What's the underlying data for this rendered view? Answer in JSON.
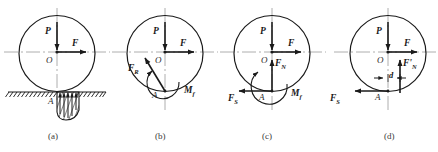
{
  "figure": {
    "stroke_color": "#1a1a1a",
    "axis_color": "#9a9a9a",
    "panels": [
      {
        "id": "a",
        "caption": "(a)",
        "center_label": "O",
        "contact_label": "A",
        "forces": [
          {
            "name": "P",
            "label": "P",
            "direction": "down"
          },
          {
            "name": "F",
            "label": "F",
            "direction": "right"
          }
        ],
        "features": [
          "ground-line",
          "hatched-ground",
          "distributed-pressure-arrows",
          "deformation-region"
        ]
      },
      {
        "id": "b",
        "caption": "(b)",
        "center_label": "O",
        "contact_label": "A",
        "forces": [
          {
            "name": "P",
            "label": "P",
            "direction": "down"
          },
          {
            "name": "F",
            "label": "F",
            "direction": "right"
          },
          {
            "name": "F_R",
            "label": "F",
            "sub": "R",
            "direction": "up-left"
          }
        ],
        "moments": [
          {
            "name": "M_f",
            "label": "M",
            "sub": "f",
            "sense": "counterclockwise"
          }
        ]
      },
      {
        "id": "c",
        "caption": "(c)",
        "center_label": "O",
        "contact_label": "A",
        "forces": [
          {
            "name": "P",
            "label": "P",
            "direction": "down"
          },
          {
            "name": "F",
            "label": "F",
            "direction": "right"
          },
          {
            "name": "F_N",
            "label": "F",
            "sub": "N",
            "direction": "up"
          },
          {
            "name": "F_S",
            "label": "F",
            "sub": "S",
            "direction": "left"
          }
        ],
        "moments": [
          {
            "name": "M_f",
            "label": "M",
            "sub": "f",
            "sense": "counterclockwise"
          }
        ]
      },
      {
        "id": "d",
        "caption": "(d)",
        "center_label": "O",
        "contact_label": "A",
        "forces": [
          {
            "name": "P",
            "label": "P",
            "direction": "down"
          },
          {
            "name": "F",
            "label": "F",
            "direction": "right"
          },
          {
            "name": "F_N_prime",
            "label": "F'",
            "sub": "N",
            "direction": "up"
          },
          {
            "name": "F_S",
            "label": "F",
            "sub": "S",
            "direction": "left"
          }
        ],
        "dimensions": [
          {
            "name": "d",
            "label": "d",
            "description": "offset of normal force from center line"
          }
        ]
      }
    ]
  }
}
